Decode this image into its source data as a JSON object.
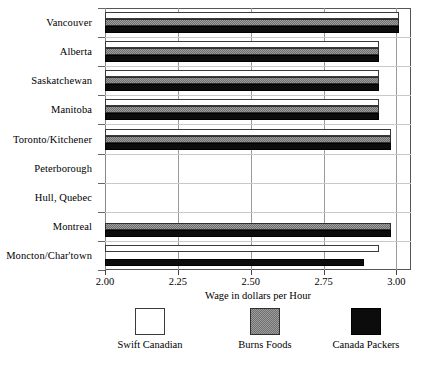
{
  "chart_data": {
    "type": "bar",
    "orientation": "horizontal",
    "title": "",
    "xlabel": "Wage in dollars per Hour",
    "ylabel": "",
    "xlim": [
      2.0,
      3.05
    ],
    "xticks": [
      2.0,
      2.25,
      2.5,
      2.75,
      3.0
    ],
    "xtick_labels": [
      "2.00",
      "2.25",
      "2.50",
      "2.75",
      "3.00"
    ],
    "grid": "vertical gridlines at 2.25, 2.50, 2.75",
    "legend_position": "below axis, horizontal",
    "categories": [
      "Vancouver",
      "Alberta",
      "Saskatchewan",
      "Manitoba",
      "Toronto/Kitchener",
      "Peterborough",
      "Hull, Quebec",
      "Montreal",
      "Moncton/Char'town"
    ],
    "series": [
      {
        "name": "Swift Canadian",
        "color": "#ffffff",
        "values": [
          3.01,
          2.94,
          2.94,
          2.94,
          2.98,
          null,
          2.0,
          null,
          2.94
        ]
      },
      {
        "name": "Burns Foods",
        "color": "#808080",
        "values": [
          3.01,
          2.94,
          2.94,
          2.94,
          2.98,
          null,
          null,
          2.98,
          null
        ]
      },
      {
        "name": "Canada Packers",
        "color": "#000000",
        "values": [
          3.01,
          2.94,
          2.94,
          2.94,
          2.98,
          null,
          null,
          2.98,
          2.89
        ]
      }
    ]
  },
  "legend": {
    "entries": [
      {
        "label": "Swift Canadian",
        "swatch": "white-square-swatch"
      },
      {
        "label": "Burns Foods",
        "swatch": "gray-dither-square-swatch"
      },
      {
        "label": "Canada Packers",
        "swatch": "black-square-swatch"
      }
    ]
  }
}
